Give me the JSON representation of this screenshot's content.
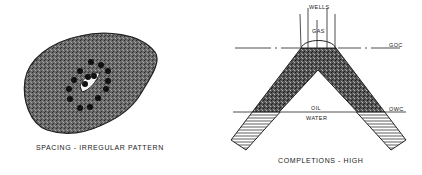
{
  "left_figure": {
    "caption": "SPACING - IRREGULAR PATTERN",
    "fill_color": "#5a5a5a",
    "well_color": "#111111",
    "wells": [
      [
        91,
        62
      ],
      [
        101,
        65
      ],
      [
        108,
        71
      ],
      [
        80,
        71
      ],
      [
        74,
        80
      ],
      [
        108,
        81
      ],
      [
        69,
        89
      ],
      [
        106,
        89
      ],
      [
        70,
        99
      ],
      [
        98,
        98
      ],
      [
        80,
        108
      ],
      [
        90,
        107
      ],
      [
        88,
        77
      ],
      [
        94,
        76
      ],
      [
        85,
        84
      ]
    ]
  },
  "right_figure": {
    "caption": "COMPLETIONS - HIGH",
    "labels": {
      "wells": "WELLS",
      "gas": "GAS",
      "goc": "GOC",
      "oil": "OIL",
      "water": "WATER",
      "owc": "OWC"
    },
    "reservoir_color": "#4a4a4a",
    "water_hatch_color": "#333333"
  }
}
